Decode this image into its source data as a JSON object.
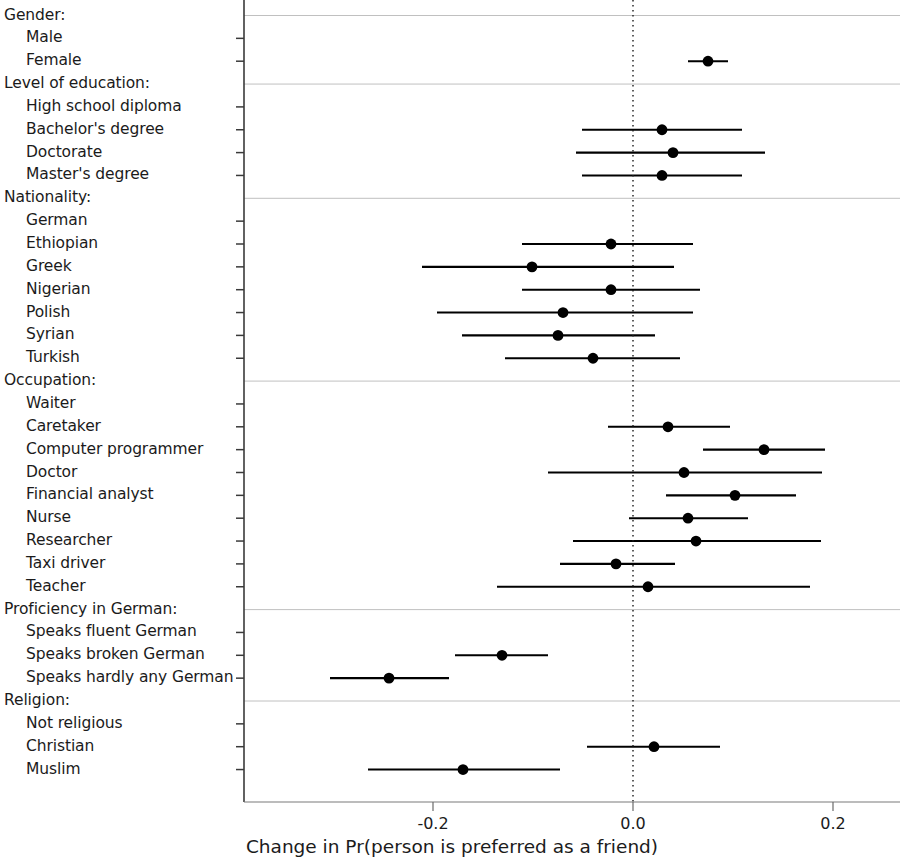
{
  "figure": {
    "x_axis_title": "Change in Pr(person is preferred as a friend)",
    "tick_labels": [
      "-0.2",
      "0.0",
      "0.2"
    ]
  },
  "chart_data": {
    "type": "scatter",
    "subtype": "coefficient-plot",
    "title": "",
    "xlabel": "Change in Pr(person is preferred as a friend)",
    "ylabel": "",
    "xlim": [
      -0.3,
      0.25
    ],
    "xticks": [
      -0.2,
      0.0,
      0.2
    ],
    "xtick_labels": [
      "-0.2",
      "0.0",
      "0.2"
    ],
    "grid": false,
    "reference_line": 0.0,
    "reference_line_style": "dotted",
    "point_color": "#000000",
    "line_color": "#000000",
    "groups": [
      {
        "name": "Gender:",
        "levels": [
          {
            "label": "Male",
            "estimate": null,
            "ci_low": null,
            "ci_high": null,
            "reference": true
          },
          {
            "label": "Female",
            "estimate": 0.075,
            "ci_low": 0.055,
            "ci_high": 0.095,
            "reference": false
          }
        ]
      },
      {
        "name": "Level of education:",
        "levels": [
          {
            "label": "High school diploma",
            "estimate": null,
            "ci_low": null,
            "ci_high": null,
            "reference": true
          },
          {
            "label": "Bachelor's degree",
            "estimate": 0.029,
            "ci_low": -0.051,
            "ci_high": 0.109,
            "reference": false
          },
          {
            "label": "Doctorate",
            "estimate": 0.04,
            "ci_low": -0.057,
            "ci_high": 0.132,
            "reference": false
          },
          {
            "label": "Master's degree",
            "estimate": 0.029,
            "ci_low": -0.051,
            "ci_high": 0.109,
            "reference": false
          }
        ]
      },
      {
        "name": "Nationality:",
        "levels": [
          {
            "label": "German",
            "estimate": null,
            "ci_low": null,
            "ci_high": null,
            "reference": true
          },
          {
            "label": "Ethiopian",
            "estimate": -0.022,
            "ci_low": -0.111,
            "ci_high": 0.06,
            "reference": false
          },
          {
            "label": "Greek",
            "estimate": -0.101,
            "ci_low": -0.211,
            "ci_high": 0.041,
            "reference": false
          },
          {
            "label": "Nigerian",
            "estimate": -0.022,
            "ci_low": -0.111,
            "ci_high": 0.067,
            "reference": false
          },
          {
            "label": "Polish",
            "estimate": -0.07,
            "ci_low": -0.196,
            "ci_high": 0.06,
            "reference": false
          },
          {
            "label": "Syrian",
            "estimate": -0.075,
            "ci_low": -0.171,
            "ci_high": 0.022,
            "reference": false
          },
          {
            "label": "Turkish",
            "estimate": -0.04,
            "ci_low": -0.128,
            "ci_high": 0.047,
            "reference": false
          }
        ]
      },
      {
        "name": "Occupation:",
        "levels": [
          {
            "label": "Waiter",
            "estimate": null,
            "ci_low": null,
            "ci_high": null,
            "reference": true
          },
          {
            "label": "Caretaker",
            "estimate": 0.035,
            "ci_low": -0.025,
            "ci_high": 0.097,
            "reference": false
          },
          {
            "label": "Computer programmer",
            "estimate": 0.131,
            "ci_low": 0.07,
            "ci_high": 0.192,
            "reference": false
          },
          {
            "label": "Doctor",
            "estimate": 0.051,
            "ci_low": -0.085,
            "ci_high": 0.189,
            "reference": false
          },
          {
            "label": "Financial analyst",
            "estimate": 0.102,
            "ci_low": 0.033,
            "ci_high": 0.163,
            "reference": false
          },
          {
            "label": "Nurse",
            "estimate": 0.055,
            "ci_low": -0.004,
            "ci_high": 0.115,
            "reference": false
          },
          {
            "label": "Researcher",
            "estimate": 0.063,
            "ci_low": -0.06,
            "ci_high": 0.188,
            "reference": false
          },
          {
            "label": "Taxi driver",
            "estimate": -0.017,
            "ci_low": -0.073,
            "ci_high": 0.042,
            "reference": false
          },
          {
            "label": "Teacher",
            "estimate": 0.015,
            "ci_low": -0.136,
            "ci_high": 0.177,
            "reference": false
          }
        ]
      },
      {
        "name": "Proficiency in German:",
        "levels": [
          {
            "label": "Speaks fluent German",
            "estimate": null,
            "ci_low": null,
            "ci_high": null,
            "reference": true
          },
          {
            "label": "Speaks broken German",
            "estimate": -0.131,
            "ci_low": -0.178,
            "ci_high": -0.085,
            "reference": false
          },
          {
            "label": "Speaks hardly any German",
            "estimate": -0.244,
            "ci_low": -0.303,
            "ci_high": -0.184,
            "reference": false
          }
        ]
      },
      {
        "name": "Religion:",
        "levels": [
          {
            "label": "Not religious",
            "estimate": null,
            "ci_low": null,
            "ci_high": null,
            "reference": true
          },
          {
            "label": "Christian",
            "estimate": 0.021,
            "ci_low": -0.046,
            "ci_high": 0.087,
            "reference": false
          },
          {
            "label": "Muslim",
            "estimate": -0.17,
            "ci_low": -0.265,
            "ci_high": -0.073,
            "reference": false
          }
        ]
      }
    ]
  }
}
